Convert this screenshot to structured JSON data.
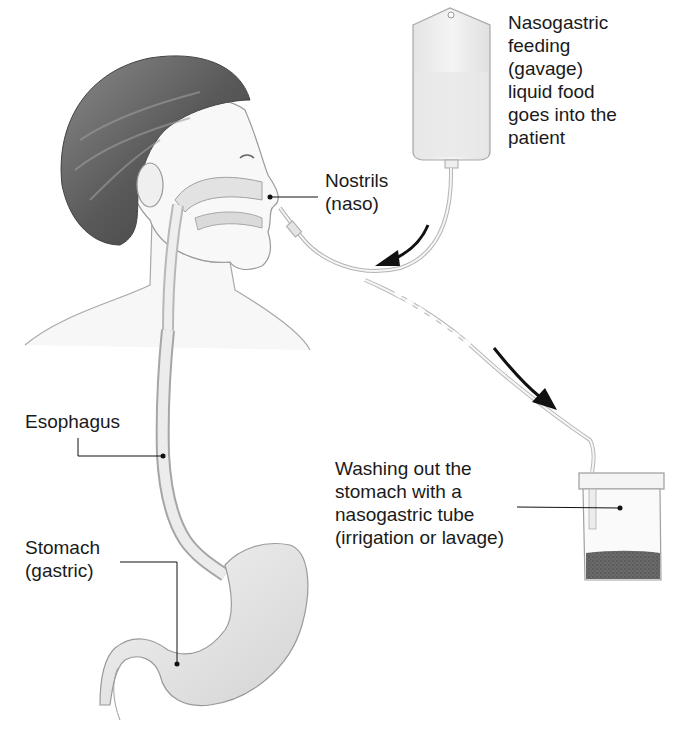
{
  "diagram": {
    "labels": {
      "feeding": {
        "lines": [
          "Nasogastric",
          "feeding",
          "(gavage)",
          "liquid food",
          "goes into the",
          "patient"
        ],
        "text": "Nasogastric\nfeeding\n(gavage)\nliquid food\ngoes into the\npatient"
      },
      "nostrils": {
        "lines": [
          "Nostrils",
          "(naso)"
        ],
        "text": "Nostrils\n(naso)"
      },
      "esophagus": {
        "lines": [
          "Esophagus"
        ],
        "text": "Esophagus"
      },
      "stomach": {
        "lines": [
          "Stomach",
          "(gastric)"
        ],
        "text": "Stomach\n(gastric)"
      },
      "washing": {
        "lines": [
          "Washing out the",
          "stomach with a",
          "nasogastric tube",
          "(irrigation or lavage)"
        ],
        "text": "Washing out the\nstomach with a\nnasogastric tube\n(irrigation or lavage)"
      }
    },
    "elements": [
      {
        "name": "feeding-bag",
        "description": "IV-style bag with liquid food"
      },
      {
        "name": "patient-head",
        "description": "side profile with nasal passage cutaway"
      },
      {
        "name": "nasogastric-tube",
        "description": "tube from nostril to stomach"
      },
      {
        "name": "esophagus",
        "description": "tube down neck"
      },
      {
        "name": "stomach",
        "description": "J-shaped organ"
      },
      {
        "name": "collection-jar",
        "description": "container with dark sediment"
      },
      {
        "name": "flow-arrow-in",
        "description": "curved arrow toward patient"
      },
      {
        "name": "flow-arrow-out",
        "description": "arrow toward collection jar"
      }
    ],
    "colors": {
      "ink": "#1a1a1a",
      "hair": "#5a5a5a",
      "skin_line": "#9a9a9a",
      "organ_fill": "#e6e6e6",
      "sediment": "#5c5c5c",
      "background": "#ffffff"
    }
  }
}
